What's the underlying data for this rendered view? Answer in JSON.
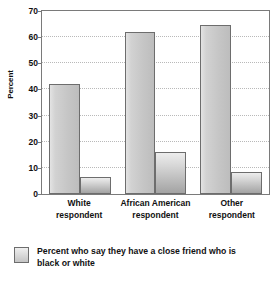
{
  "chart_data": {
    "type": "bar",
    "title": "",
    "xlabel": "",
    "ylabel": "Percent",
    "ylim": [
      0,
      70
    ],
    "yticks": [
      0,
      10,
      20,
      30,
      40,
      50,
      60,
      70
    ],
    "grid": true,
    "legend_position": "bottom-left",
    "categories": [
      "White respondent",
      "African American respondent",
      "Other respondent"
    ],
    "category_lines": [
      {
        "line1": "White",
        "line2": "respondent"
      },
      {
        "line1": "African American",
        "line2": "respondent"
      },
      {
        "line1": "Other",
        "line2": "respondent"
      }
    ],
    "series": [
      {
        "name": "Percent who say they have a close friend who is black or white",
        "values": [
          42,
          62,
          64.5
        ]
      },
      {
        "name": "Second bar",
        "values": [
          6.5,
          16,
          8.5
        ]
      }
    ],
    "legend": [
      {
        "swatch": "light-gray",
        "line1": "Percent who say they have a close friend who",
        "line2": "is black or white"
      }
    ],
    "colors": {
      "bar_fill_light": "#d2d2d2",
      "bar_fill_dark": "#b6b6b6",
      "bar_border": "#6d6d6d",
      "gridline": "#b9b9b9",
      "axis": "#7a7a7a",
      "text": "#111111",
      "background": "#ffffff"
    }
  }
}
